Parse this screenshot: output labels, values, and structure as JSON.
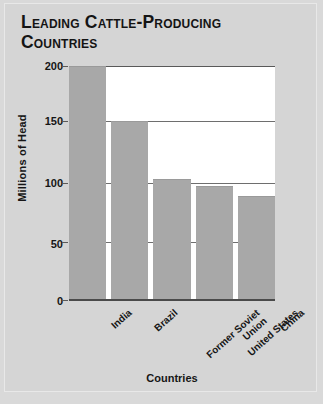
{
  "chart_data": {
    "type": "bar",
    "title": "Leading Cattle-Producing Countries",
    "categories": [
      "India",
      "Brazil",
      "Former Soviet\nUnion",
      "United States",
      "China"
    ],
    "values": [
      200,
      153,
      104,
      98,
      89
    ],
    "xlabel": "Countries",
    "ylabel": "Millions of Head",
    "ylim": [
      0,
      200
    ],
    "yticks": [
      "0",
      "50",
      "100",
      "150",
      "200"
    ],
    "grid": true,
    "legend": "none",
    "bar_color": "#a8a8a8",
    "plot_background": "#ffffff",
    "figure_background": "#d5d5d5"
  }
}
